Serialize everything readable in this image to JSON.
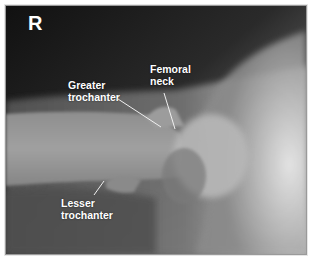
{
  "image": {
    "type": "radiograph",
    "description": "Hip X-ray with anatomical annotations",
    "side_marker": "R"
  },
  "annotations": [
    {
      "id": "greater-trochanter",
      "line1": "Greater",
      "line2": "trochanter"
    },
    {
      "id": "femoral-neck",
      "line1": "Femoral",
      "line2": "neck"
    },
    {
      "id": "lesser-trochanter",
      "line1": "Lesser",
      "line2": "trochanter"
    }
  ],
  "colors": {
    "label_text": "#ffffff",
    "leader_line": "#f0f0f0",
    "frame_border": "#9a9a9a"
  }
}
